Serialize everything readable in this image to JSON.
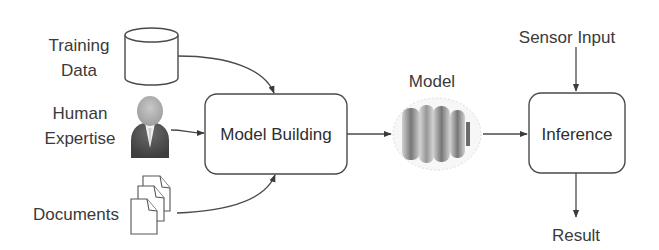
{
  "diagram": {
    "type": "flowchart",
    "inputs": {
      "training_data": {
        "line1": "Training",
        "line2": "Data",
        "icon": "database-cylinder-icon"
      },
      "human_expertise": {
        "line1": "Human",
        "line2": "Expertise",
        "icon": "person-icon"
      },
      "documents": {
        "label": "Documents",
        "icon": "documents-stack-icon"
      }
    },
    "nodes": {
      "model_building": {
        "label": "Model Building"
      },
      "model": {
        "label": "Model",
        "icon": "model-blob-icon"
      },
      "inference": {
        "label": "Inference"
      }
    },
    "external": {
      "sensor_input": {
        "label": "Sensor Input"
      },
      "result": {
        "label": "Result"
      }
    },
    "edges": [
      {
        "from": "Training Data",
        "to": "Model Building"
      },
      {
        "from": "Human Expertise",
        "to": "Model Building"
      },
      {
        "from": "Documents",
        "to": "Model Building"
      },
      {
        "from": "Model Building",
        "to": "Model"
      },
      {
        "from": "Model",
        "to": "Inference"
      },
      {
        "from": "Sensor Input",
        "to": "Inference"
      },
      {
        "from": "Inference",
        "to": "Result"
      }
    ],
    "colors": {
      "stroke": "#4a4a4a",
      "text": "#333333",
      "person_head": "#b5b5b5",
      "person_body": "#555555",
      "model_band": "#7a7a7a"
    }
  }
}
